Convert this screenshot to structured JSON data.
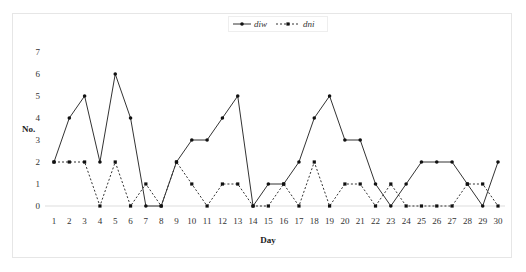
{
  "chart_data": {
    "type": "line",
    "title": "",
    "xlabel": "Day",
    "ylabel": "No.",
    "x": [
      1,
      2,
      3,
      4,
      5,
      6,
      7,
      8,
      9,
      10,
      11,
      12,
      13,
      14,
      15,
      16,
      17,
      18,
      19,
      20,
      21,
      22,
      23,
      24,
      25,
      26,
      27,
      28,
      29,
      30
    ],
    "series": [
      {
        "name": "diw",
        "style": "solid",
        "values": [
          2,
          4,
          5,
          2,
          6,
          4,
          0,
          0,
          2,
          3,
          3,
          4,
          5,
          0,
          1,
          1,
          2,
          4,
          5,
          3,
          3,
          1,
          0,
          1,
          2,
          2,
          2,
          1,
          0,
          2
        ]
      },
      {
        "name": "dni",
        "style": "dotted",
        "values": [
          2,
          2,
          2,
          0,
          2,
          0,
          1,
          0,
          2,
          1,
          0,
          1,
          1,
          0,
          0,
          1,
          0,
          2,
          0,
          1,
          1,
          0,
          1,
          0,
          0,
          0,
          0,
          1,
          1,
          0
        ]
      }
    ],
    "yticks": [
      0,
      1,
      2,
      3,
      4,
      5,
      6,
      7
    ],
    "ylim": [
      0,
      7
    ],
    "xlim": [
      1,
      30
    ],
    "grid": false,
    "legend_position": "top-center",
    "colors": {
      "line": "#333333",
      "marker": "#111111",
      "baseline": "#dddddd"
    }
  },
  "legend": {
    "items": [
      {
        "label": "diw"
      },
      {
        "label": "dni"
      }
    ]
  },
  "axes": {
    "xlabel": "Day",
    "ylabel": "No."
  }
}
